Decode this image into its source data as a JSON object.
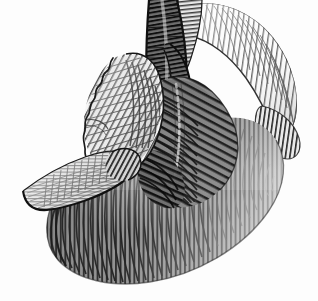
{
  "figure": {
    "title": "Anatomical illustration of the human heart",
    "style": "monochrome engraving with line hatching",
    "medium": "pen-and-ink hatched line drawing",
    "orientation": "anterior-superior oblique view, apex to lower left",
    "background_color": "#fdfdfd",
    "canvas": {
      "width": 318,
      "height": 301
    }
  },
  "palette": {
    "background": "#fdfdfd",
    "ink": "#151515",
    "ink_soft": "#3a3a3a",
    "ventricle_mid": "#8d8d8d",
    "ventricle_dark": "#6e6e6e",
    "ventricle_deep": "#4a4a4a",
    "atrium_light": "#f4f4f4",
    "atrium_shade": "#dedede",
    "vessel_light": "#f7f7f7",
    "vessel_dark": "#595959",
    "groove_shadow": "#2e2e2e"
  },
  "structures": [
    {
      "id": "ventricular-mass",
      "label": "Ventricular mass",
      "tone": "mid to dark gray",
      "hatching": "dense near-vertical strokes curving with the surface",
      "notes": "large rounded body occupying the lower two thirds, apex toward lower left"
    },
    {
      "id": "left-atrial-appendage",
      "label": "Left atrial appendage (auricle)",
      "tone": "light, nearly white",
      "hatching": "fine close horizontal strokes",
      "notes": "tapering pointed lobe projecting to the far left"
    },
    {
      "id": "atrium-cut-lobe",
      "label": "Atrial wall with cut margin",
      "tone": "light with gray shading",
      "hatching": "parallel oblique strokes",
      "notes": "scalloped zigzag cut edge along its upper-left border"
    },
    {
      "id": "pulmonary-trunk",
      "label": "Pulmonary trunk",
      "tone": "dark gray with heavy outline",
      "hatching": "short transverse ticks",
      "notes": "descends through the centre of the field, truncated at the top edge"
    },
    {
      "id": "aortic-arch",
      "label": "Aortic arch and branch",
      "tone": "light with fine hatching",
      "hatching": "radiating fine strokes following the curvature",
      "notes": "pale curved band sweeping over the upper right, cut at the top edge"
    },
    {
      "id": "great-vessel-stump",
      "label": "Great vessel stump",
      "tone": "light gray",
      "hatching": "fine parallel ticks",
      "notes": "second trunk cut at the top margin beside the pulmonary trunk"
    },
    {
      "id": "coronary-groove",
      "label": "Atrioventricular (coronary) groove",
      "tone": "deep shadow",
      "hatching": "convergent strokes",
      "notes": "dark crease separating the light atrial region from the dark ventricle"
    },
    {
      "id": "coronary-vessel",
      "label": "Coronary vessel on ventricular surface",
      "tone": "light stipple over gray",
      "hatching": "broken dotted track",
      "notes": "runs obliquely down the upper right ventricular surface"
    }
  ],
  "labels": {
    "has_text_annotations": false,
    "note": "no captions, axis ticks, legend or printed text appear anywhere in the image"
  }
}
